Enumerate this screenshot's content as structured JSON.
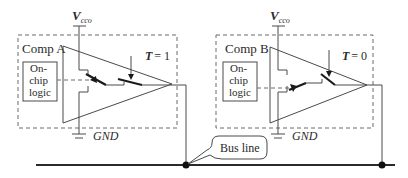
{
  "diagram": {
    "title": "",
    "components": [
      {
        "name": "Comp A",
        "supply_label": "V",
        "supply_subscript": "cco",
        "ground_label": "GND",
        "logic_label_lines": [
          "On-",
          "chip",
          "logic"
        ],
        "control_label": "T = 1",
        "control_var": "T",
        "control_value": "= 1"
      },
      {
        "name": "Comp B",
        "supply_label": "V",
        "supply_subscript": "cco",
        "ground_label": "GND",
        "logic_label_lines": [
          "On-",
          "chip",
          "logic"
        ],
        "control_label": "T = 0",
        "control_var": "T",
        "control_value": "= 0"
      }
    ],
    "bus_label": "Bus line",
    "colors": {
      "line": "#4a4a4a",
      "dashed_border": "#6a6a6a",
      "text": "#2a2a2a",
      "background": "#ffffff"
    }
  }
}
